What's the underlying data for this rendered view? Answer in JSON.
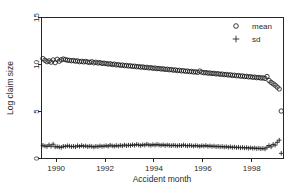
{
  "chart_data": {
    "type": "scatter",
    "title": "",
    "xlabel": "Accident month",
    "ylabel": "Log claim size",
    "xlim": [
      1989.4,
      1999.3
    ],
    "ylim": [
      0,
      15
    ],
    "xticks": [
      1990,
      1992,
      1994,
      1996,
      1998
    ],
    "xticklabels": [
      "1990",
      "1992",
      "1994",
      "1996",
      "1998"
    ],
    "yticks": [
      0,
      5,
      10,
      15
    ],
    "yticklabels": [
      "0",
      "5",
      "10",
      "15"
    ],
    "grid": false,
    "legend_position": "top-right",
    "legend": [
      {
        "marker": "circle-open",
        "label": "mean"
      },
      {
        "marker": "plus",
        "label": "sd"
      }
    ],
    "x": [
      1989.458,
      1989.542,
      1989.625,
      1989.708,
      1989.792,
      1989.875,
      1989.958,
      1990.042,
      1990.125,
      1990.208,
      1990.292,
      1990.375,
      1990.458,
      1990.542,
      1990.625,
      1990.708,
      1990.792,
      1990.875,
      1990.958,
      1991.042,
      1991.125,
      1991.208,
      1991.292,
      1991.375,
      1991.458,
      1991.542,
      1991.625,
      1991.708,
      1991.792,
      1991.875,
      1991.958,
      1992.042,
      1992.125,
      1992.208,
      1992.292,
      1992.375,
      1992.458,
      1992.542,
      1992.625,
      1992.708,
      1992.792,
      1992.875,
      1992.958,
      1993.042,
      1993.125,
      1993.208,
      1993.292,
      1993.375,
      1993.458,
      1993.542,
      1993.625,
      1993.708,
      1993.792,
      1993.875,
      1993.958,
      1994.042,
      1994.125,
      1994.208,
      1994.292,
      1994.375,
      1994.458,
      1994.542,
      1994.625,
      1994.708,
      1994.792,
      1994.875,
      1994.958,
      1995.042,
      1995.125,
      1995.208,
      1995.292,
      1995.375,
      1995.458,
      1995.542,
      1995.625,
      1995.708,
      1995.792,
      1995.875,
      1995.958,
      1996.042,
      1996.125,
      1996.208,
      1996.292,
      1996.375,
      1996.458,
      1996.542,
      1996.625,
      1996.708,
      1996.792,
      1996.875,
      1996.958,
      1997.042,
      1997.125,
      1997.208,
      1997.292,
      1997.375,
      1997.458,
      1997.542,
      1997.625,
      1997.708,
      1997.792,
      1997.875,
      1997.958,
      1998.042,
      1998.125,
      1998.208,
      1998.292,
      1998.375,
      1998.458,
      1998.542,
      1998.625,
      1998.708,
      1998.792,
      1998.875,
      1998.958,
      1999.042,
      1999.125,
      1999.208
    ],
    "series": [
      {
        "name": "mean",
        "marker": "circle-open",
        "values": [
          10.62,
          10.45,
          10.3,
          10.38,
          10.25,
          10.48,
          10.2,
          10.55,
          10.35,
          10.5,
          10.58,
          10.52,
          10.46,
          10.44,
          10.4,
          10.42,
          10.36,
          10.38,
          10.3,
          10.34,
          10.28,
          10.32,
          10.26,
          10.22,
          10.3,
          10.18,
          10.24,
          10.16,
          10.2,
          10.12,
          10.14,
          10.1,
          10.05,
          10.08,
          10.0,
          10.04,
          9.96,
          9.98,
          9.92,
          9.94,
          9.88,
          9.9,
          9.84,
          9.86,
          9.8,
          9.82,
          9.76,
          9.78,
          9.72,
          9.74,
          9.68,
          9.7,
          9.64,
          9.66,
          9.6,
          9.62,
          9.56,
          9.58,
          9.52,
          9.54,
          9.48,
          9.5,
          9.44,
          9.46,
          9.4,
          9.42,
          9.36,
          9.38,
          9.32,
          9.34,
          9.28,
          9.3,
          9.24,
          9.26,
          9.2,
          9.22,
          9.16,
          9.3,
          9.18,
          9.12,
          9.14,
          9.08,
          9.1,
          9.04,
          9.06,
          9.0,
          9.02,
          8.96,
          8.98,
          8.92,
          8.94,
          8.88,
          8.9,
          8.84,
          8.86,
          8.8,
          8.82,
          8.76,
          8.78,
          8.72,
          8.74,
          8.68,
          8.7,
          8.64,
          8.66,
          8.6,
          8.62,
          8.56,
          8.58,
          8.52,
          8.72,
          8.3,
          8.1,
          7.95,
          7.8,
          7.6,
          7.4,
          5.05
        ]
      },
      {
        "name": "sd",
        "marker": "plus",
        "values": [
          1.4,
          1.32,
          1.28,
          1.44,
          1.3,
          1.52,
          1.24,
          1.26,
          1.22,
          1.18,
          1.3,
          1.28,
          1.35,
          1.32,
          1.26,
          1.3,
          1.24,
          1.36,
          1.28,
          1.38,
          1.3,
          1.34,
          1.26,
          1.32,
          1.28,
          1.22,
          1.3,
          1.26,
          1.34,
          1.28,
          1.32,
          1.36,
          1.3,
          1.42,
          1.34,
          1.3,
          1.38,
          1.32,
          1.4,
          1.34,
          1.44,
          1.36,
          1.42,
          1.38,
          1.46,
          1.4,
          1.5,
          1.44,
          1.38,
          1.46,
          1.42,
          1.52,
          1.44,
          1.4,
          1.48,
          1.42,
          1.5,
          1.44,
          1.4,
          1.46,
          1.38,
          1.44,
          1.4,
          1.36,
          1.42,
          1.38,
          1.34,
          1.4,
          1.36,
          1.44,
          1.38,
          1.34,
          1.4,
          1.36,
          1.32,
          1.38,
          1.34,
          1.3,
          1.36,
          1.32,
          1.38,
          1.3,
          1.34,
          1.28,
          1.32,
          1.26,
          1.3,
          1.24,
          1.28,
          1.22,
          1.26,
          1.2,
          1.24,
          1.18,
          1.22,
          1.16,
          1.2,
          1.14,
          1.18,
          1.12,
          1.16,
          1.1,
          1.14,
          1.08,
          1.12,
          1.06,
          1.1,
          1.04,
          1.08,
          1.02,
          1.2,
          1.38,
          1.24,
          1.5,
          1.42,
          1.72,
          1.95,
          0.55
        ]
      }
    ]
  }
}
